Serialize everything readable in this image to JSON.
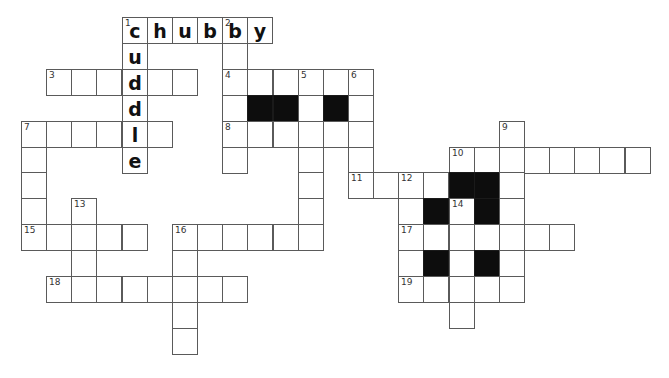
{
  "puzzle": {
    "title": "Crossword",
    "cells": [
      {
        "c": 4,
        "r": 0,
        "n": "1",
        "l": "c"
      },
      {
        "c": 5,
        "r": 0,
        "l": "h"
      },
      {
        "c": 6,
        "r": 0,
        "l": "u"
      },
      {
        "c": 7,
        "r": 0,
        "l": "b"
      },
      {
        "c": 8,
        "r": 0,
        "n": "2",
        "l": "b"
      },
      {
        "c": 9,
        "r": 0,
        "l": "y"
      },
      {
        "c": 4,
        "r": 1,
        "l": "u"
      },
      {
        "c": 8,
        "r": 1
      },
      {
        "c": 1,
        "r": 2,
        "n": "3"
      },
      {
        "c": 2,
        "r": 2
      },
      {
        "c": 3,
        "r": 2
      },
      {
        "c": 4,
        "r": 2,
        "l": "d"
      },
      {
        "c": 5,
        "r": 2
      },
      {
        "c": 6,
        "r": 2
      },
      {
        "c": 8,
        "r": 2,
        "n": "4"
      },
      {
        "c": 9,
        "r": 2
      },
      {
        "c": 10,
        "r": 2
      },
      {
        "c": 11,
        "r": 2,
        "n": "5"
      },
      {
        "c": 12,
        "r": 2
      },
      {
        "c": 13,
        "r": 2,
        "n": "6"
      },
      {
        "c": 4,
        "r": 3,
        "l": "d"
      },
      {
        "c": 8,
        "r": 3
      },
      {
        "c": 9,
        "r": 3,
        "b": true
      },
      {
        "c": 10,
        "r": 3,
        "b": true
      },
      {
        "c": 11,
        "r": 3
      },
      {
        "c": 12,
        "r": 3,
        "b": true
      },
      {
        "c": 13,
        "r": 3
      },
      {
        "c": 0,
        "r": 4,
        "n": "7"
      },
      {
        "c": 1,
        "r": 4
      },
      {
        "c": 2,
        "r": 4
      },
      {
        "c": 3,
        "r": 4
      },
      {
        "c": 4,
        "r": 4,
        "l": "l"
      },
      {
        "c": 5,
        "r": 4
      },
      {
        "c": 8,
        "r": 4,
        "n": "8"
      },
      {
        "c": 9,
        "r": 4
      },
      {
        "c": 10,
        "r": 4
      },
      {
        "c": 11,
        "r": 4
      },
      {
        "c": 12,
        "r": 4
      },
      {
        "c": 13,
        "r": 4
      },
      {
        "c": 19,
        "r": 4,
        "n": "9"
      },
      {
        "c": 0,
        "r": 5
      },
      {
        "c": 4,
        "r": 5,
        "l": "e"
      },
      {
        "c": 8,
        "r": 5
      },
      {
        "c": 11,
        "r": 5
      },
      {
        "c": 13,
        "r": 5
      },
      {
        "c": 17,
        "r": 5,
        "n": "10"
      },
      {
        "c": 18,
        "r": 5
      },
      {
        "c": 19,
        "r": 5
      },
      {
        "c": 20,
        "r": 5
      },
      {
        "c": 21,
        "r": 5
      },
      {
        "c": 22,
        "r": 5
      },
      {
        "c": 23,
        "r": 5
      },
      {
        "c": 24,
        "r": 5
      },
      {
        "c": 0,
        "r": 6
      },
      {
        "c": 11,
        "r": 6
      },
      {
        "c": 13,
        "r": 6,
        "n": "11"
      },
      {
        "c": 14,
        "r": 6
      },
      {
        "c": 15,
        "r": 6,
        "n": "12"
      },
      {
        "c": 16,
        "r": 6
      },
      {
        "c": 17,
        "r": 6,
        "b": true
      },
      {
        "c": 18,
        "r": 6,
        "b": true
      },
      {
        "c": 19,
        "r": 6
      },
      {
        "c": 0,
        "r": 7
      },
      {
        "c": 2,
        "r": 7,
        "n": "13"
      },
      {
        "c": 11,
        "r": 7
      },
      {
        "c": 15,
        "r": 7
      },
      {
        "c": 16,
        "r": 7,
        "b": true
      },
      {
        "c": 17,
        "r": 7,
        "n": "14"
      },
      {
        "c": 18,
        "r": 7,
        "b": true
      },
      {
        "c": 19,
        "r": 7
      },
      {
        "c": 0,
        "r": 8,
        "n": "15"
      },
      {
        "c": 1,
        "r": 8
      },
      {
        "c": 2,
        "r": 8
      },
      {
        "c": 3,
        "r": 8
      },
      {
        "c": 4,
        "r": 8
      },
      {
        "c": 6,
        "r": 8,
        "n": "16"
      },
      {
        "c": 7,
        "r": 8
      },
      {
        "c": 8,
        "r": 8
      },
      {
        "c": 9,
        "r": 8
      },
      {
        "c": 10,
        "r": 8
      },
      {
        "c": 11,
        "r": 8
      },
      {
        "c": 15,
        "r": 8,
        "n": "17"
      },
      {
        "c": 16,
        "r": 8
      },
      {
        "c": 17,
        "r": 8
      },
      {
        "c": 18,
        "r": 8
      },
      {
        "c": 19,
        "r": 8
      },
      {
        "c": 20,
        "r": 8
      },
      {
        "c": 21,
        "r": 8
      },
      {
        "c": 2,
        "r": 9
      },
      {
        "c": 6,
        "r": 9
      },
      {
        "c": 15,
        "r": 9
      },
      {
        "c": 16,
        "r": 9,
        "b": true
      },
      {
        "c": 17,
        "r": 9
      },
      {
        "c": 18,
        "r": 9,
        "b": true
      },
      {
        "c": 19,
        "r": 9
      },
      {
        "c": 1,
        "r": 10,
        "n": "18"
      },
      {
        "c": 2,
        "r": 10
      },
      {
        "c": 3,
        "r": 10
      },
      {
        "c": 4,
        "r": 10
      },
      {
        "c": 5,
        "r": 10
      },
      {
        "c": 6,
        "r": 10
      },
      {
        "c": 7,
        "r": 10
      },
      {
        "c": 8,
        "r": 10
      },
      {
        "c": 15,
        "r": 10,
        "n": "19"
      },
      {
        "c": 16,
        "r": 10
      },
      {
        "c": 17,
        "r": 10
      },
      {
        "c": 18,
        "r": 10
      },
      {
        "c": 19,
        "r": 10
      },
      {
        "c": 6,
        "r": 11
      },
      {
        "c": 17,
        "r": 11
      },
      {
        "c": 6,
        "r": 12
      }
    ]
  }
}
